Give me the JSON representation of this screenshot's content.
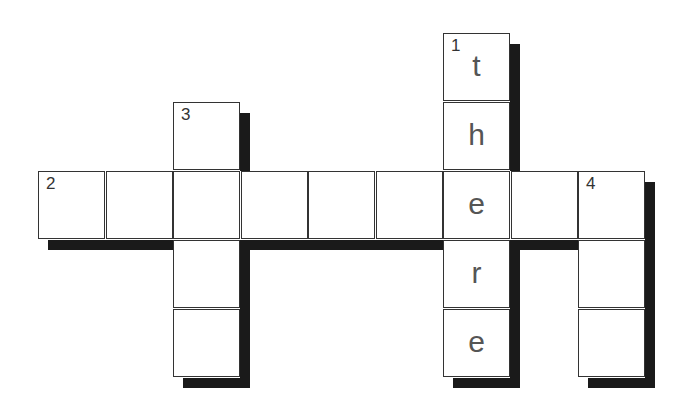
{
  "puzzle": {
    "type": "crossword",
    "grid": {
      "cell_size": 67.5,
      "origin_x": 38,
      "origin_y": 33,
      "colors": {
        "border": "#333333",
        "shadow": "#1a1a1a",
        "background": "#ffffff",
        "letter": "#555555",
        "number": "#333333"
      }
    },
    "clues": [
      {
        "number": "1",
        "direction": "down",
        "row": 0,
        "col": 6,
        "length": 5,
        "answer": [
          "t",
          "h",
          "e",
          "r",
          "e"
        ]
      },
      {
        "number": "2",
        "direction": "across",
        "row": 2,
        "col": 0,
        "length": 9,
        "answer": [
          "",
          "",
          "",
          "",
          "",
          "",
          "e",
          "",
          ""
        ]
      },
      {
        "number": "3",
        "direction": "down",
        "row": 1,
        "col": 2,
        "length": 4,
        "answer": [
          "",
          "",
          "",
          ""
        ]
      },
      {
        "number": "4",
        "direction": "down",
        "row": 2,
        "col": 8,
        "length": 3,
        "answer": [
          "",
          "",
          ""
        ]
      }
    ],
    "cells": [
      {
        "row": 0,
        "col": 6,
        "number": "1",
        "letter": "t"
      },
      {
        "row": 1,
        "col": 2,
        "number": "3",
        "letter": ""
      },
      {
        "row": 1,
        "col": 6,
        "number": "",
        "letter": "h"
      },
      {
        "row": 2,
        "col": 0,
        "number": "2",
        "letter": ""
      },
      {
        "row": 2,
        "col": 1,
        "number": "",
        "letter": ""
      },
      {
        "row": 2,
        "col": 2,
        "number": "",
        "letter": ""
      },
      {
        "row": 2,
        "col": 3,
        "number": "",
        "letter": ""
      },
      {
        "row": 2,
        "col": 4,
        "number": "",
        "letter": ""
      },
      {
        "row": 2,
        "col": 5,
        "number": "",
        "letter": ""
      },
      {
        "row": 2,
        "col": 6,
        "number": "",
        "letter": "e"
      },
      {
        "row": 2,
        "col": 7,
        "number": "",
        "letter": ""
      },
      {
        "row": 2,
        "col": 8,
        "number": "4",
        "letter": ""
      },
      {
        "row": 3,
        "col": 2,
        "number": "",
        "letter": ""
      },
      {
        "row": 3,
        "col": 6,
        "number": "",
        "letter": "r"
      },
      {
        "row": 3,
        "col": 8,
        "number": "",
        "letter": ""
      },
      {
        "row": 4,
        "col": 2,
        "number": "",
        "letter": ""
      },
      {
        "row": 4,
        "col": 6,
        "number": "",
        "letter": "e"
      },
      {
        "row": 4,
        "col": 8,
        "number": "",
        "letter": ""
      }
    ]
  }
}
